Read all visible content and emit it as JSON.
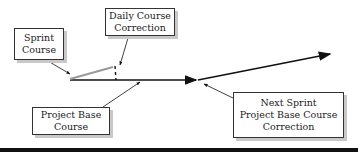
{
  "diagram": {
    "boxes": {
      "sprint_course": {
        "lines": [
          "Sprint",
          "Course"
        ]
      },
      "daily_correction": {
        "lines": [
          "Daily Course",
          "Correction"
        ]
      },
      "project_base": {
        "lines": [
          "Project Base",
          "Course"
        ]
      },
      "next_sprint": {
        "lines": [
          "Next Sprint",
          "Project Base Course",
          "Correction"
        ]
      }
    },
    "colors": {
      "line": "#111111",
      "sprint_line": "#9a9a9a",
      "shadow": "#c8c8c8",
      "bottom_bar": "#111111"
    }
  }
}
